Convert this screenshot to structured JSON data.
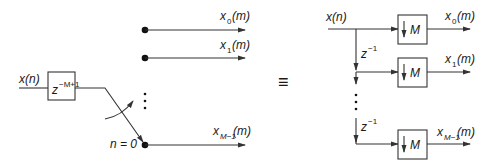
{
  "left_diagram": {
    "input_label": "x(n)",
    "delay_block": {
      "base": "z",
      "exponent": "−M+1"
    },
    "switch_label": "n = 0",
    "outputs": [
      {
        "base": "x",
        "sub": "0",
        "arg": "(m)"
      },
      {
        "base": "x",
        "sub": "1",
        "arg": "(m)"
      },
      {
        "base": "x",
        "sub": "M−1",
        "arg": "(m)"
      }
    ],
    "ellipsis": "⋮"
  },
  "equivalence_symbol": "≡",
  "right_diagram": {
    "input_label": "x(n)",
    "delay_labels": [
      {
        "base": "z",
        "exponent": "−1"
      },
      {
        "base": "z",
        "exponent": "−1"
      }
    ],
    "decimator_blocks": [
      {
        "arrow": "↓",
        "factor": "M"
      },
      {
        "arrow": "↓",
        "factor": "M"
      },
      {
        "arrow": "↓",
        "factor": "M"
      }
    ],
    "outputs": [
      {
        "base": "x",
        "sub": "0",
        "arg": "(m)"
      },
      {
        "base": "x",
        "sub": "1",
        "arg": "(m)"
      },
      {
        "base": "x",
        "sub": "M−1",
        "arg": "(m)"
      }
    ]
  },
  "colors": {
    "line": "#333333",
    "text": "#1a1a1a",
    "background": "#ffffff"
  }
}
